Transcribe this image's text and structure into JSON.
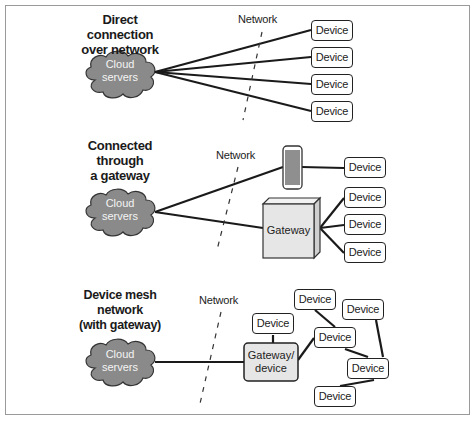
{
  "panels": [
    {
      "title_lines": [
        "Direct connection",
        "over network"
      ],
      "cloud": {
        "label_lines": [
          "Cloud",
          "servers"
        ]
      },
      "network_label": "Network",
      "devices": [
        "Device",
        "Device",
        "Device",
        "Device"
      ]
    },
    {
      "title_lines": [
        "Connected",
        "through",
        "a gateway"
      ],
      "cloud": {
        "label_lines": [
          "Cloud",
          "servers"
        ]
      },
      "network_label": "Network",
      "phone_device": "Device",
      "gateway_label": "Gateway",
      "devices": [
        "Device",
        "Device",
        "Device"
      ]
    },
    {
      "title_lines": [
        "Device mesh",
        "network",
        "(with gateway)"
      ],
      "cloud": {
        "label_lines": [
          "Cloud",
          "servers"
        ]
      },
      "network_label": "Network",
      "gateway_label_lines": [
        "Gateway/",
        "device"
      ],
      "devices": [
        "Device",
        "Device",
        "Device",
        "Device",
        "Device",
        "Device"
      ]
    }
  ],
  "colors": {
    "cloud_fill": "#8a8a8a",
    "gateway_fill": "#e6e6e6",
    "phone_fill": "#8f8f8f",
    "line": "#1a1a1a",
    "frame": "#9a9a9a"
  }
}
